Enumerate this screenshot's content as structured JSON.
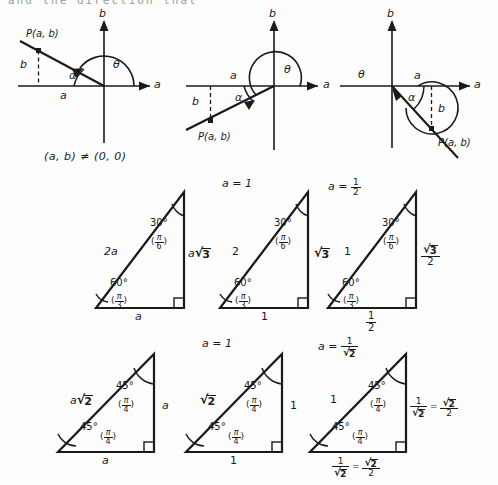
{
  "figure": {
    "cut_off_header_text": "and the direction that",
    "condition_note": "(a, b) ≠ (0, 0)"
  },
  "axis_diagrams": [
    {
      "name": "quadrant-II-diagram",
      "quadrant": "II",
      "axis_label_x": "a",
      "axis_label_y": "b",
      "point_label": "P(a, b)",
      "leg_horizontal_label": "a",
      "leg_vertical_label": "b",
      "angle_theta": "θ",
      "angle_alpha": "α",
      "ray_direction": "up-left"
    },
    {
      "name": "quadrant-III-diagram",
      "quadrant": "III",
      "axis_label_x": "a",
      "axis_label_y": "b",
      "point_label": "P(a, b)",
      "leg_horizontal_label": "a",
      "leg_vertical_label": "b",
      "angle_theta": "θ",
      "angle_alpha": "α",
      "ray_direction": "down-left"
    },
    {
      "name": "quadrant-IV-diagram",
      "quadrant": "IV",
      "axis_label_x": "a",
      "axis_label_y": "b",
      "point_label": "P(a, b)",
      "leg_horizontal_label": "a",
      "leg_vertical_label": "b",
      "angle_theta": "θ",
      "angle_alpha": "α",
      "ray_direction": "down-right"
    }
  ],
  "triangles_30_60_90": [
    {
      "name": "triangle-30-60-90-general",
      "caption": "",
      "hypotenuse": "2a",
      "vertical_leg": "a√3",
      "base": "a",
      "top_angle_deg": "30°",
      "top_angle_rad_num": "π",
      "top_angle_rad_den": "6",
      "bottom_angle_deg": "60°",
      "bottom_angle_rad_num": "π",
      "bottom_angle_rad_den": "3"
    },
    {
      "name": "triangle-30-60-90-a-equals-1",
      "caption": "a = 1",
      "hypotenuse": "2",
      "vertical_leg": "√3",
      "base": "1",
      "top_angle_deg": "30°",
      "top_angle_rad_num": "π",
      "top_angle_rad_den": "6",
      "bottom_angle_deg": "60°",
      "bottom_angle_rad_num": "π",
      "bottom_angle_rad_den": "3"
    },
    {
      "name": "triangle-30-60-90-a-equals-half",
      "caption": "a = 1/2",
      "caption_prefix": "a =",
      "caption_num": "1",
      "caption_den": "2",
      "hypotenuse": "1",
      "vertical_leg_num": "√3",
      "vertical_leg_den": "2",
      "base_num": "1",
      "base_den": "2",
      "top_angle_deg": "30°",
      "top_angle_rad_num": "π",
      "top_angle_rad_den": "6",
      "bottom_angle_deg": "60°",
      "bottom_angle_rad_num": "π",
      "bottom_angle_rad_den": "3"
    }
  ],
  "triangles_45_45_90": [
    {
      "name": "triangle-45-45-90-general",
      "caption": "",
      "hypotenuse": "a√2",
      "vertical_leg": "a",
      "base": "a",
      "top_angle_deg": "45°",
      "top_angle_rad_num": "π",
      "top_angle_rad_den": "4",
      "bottom_angle_deg": "45°",
      "bottom_angle_rad_num": "π",
      "bottom_angle_rad_den": "4"
    },
    {
      "name": "triangle-45-45-90-a-equals-1",
      "caption": "a = 1",
      "hypotenuse": "√2",
      "vertical_leg": "1",
      "base": "1",
      "top_angle_deg": "45°",
      "top_angle_rad_num": "π",
      "top_angle_rad_den": "4",
      "bottom_angle_deg": "45°",
      "bottom_angle_rad_num": "π",
      "bottom_angle_rad_den": "4"
    },
    {
      "name": "triangle-45-45-90-a-equals-one-over-root-two",
      "caption_prefix": "a =",
      "caption_num": "1",
      "caption_den": "√2",
      "hypotenuse": "1",
      "vertical_leg_left_num": "1",
      "vertical_leg_left_den": "√2",
      "vertical_leg_equals": "=",
      "vertical_leg_right_num": "√2",
      "vertical_leg_right_den": "2",
      "base_left_num": "1",
      "base_left_den": "√2",
      "base_equals": "=",
      "base_right_num": "√2",
      "base_right_den": "2",
      "top_angle_deg": "45°",
      "top_angle_rad_num": "π",
      "top_angle_rad_den": "4",
      "bottom_angle_deg": "45°",
      "bottom_angle_rad_num": "π",
      "bottom_angle_rad_den": "4"
    }
  ],
  "colors": {
    "ink": "#1a1a1a",
    "paper": "#fdfdfd",
    "faded": "#9a9a9a"
  }
}
